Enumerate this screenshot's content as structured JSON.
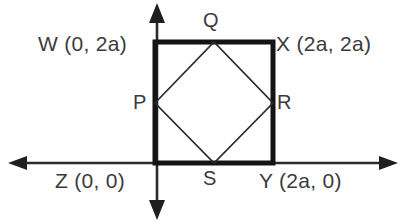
{
  "figure": {
    "background_color": "#ffffff",
    "stroke_color": "#1a1a1a",
    "label_color": "#3b3b3b",
    "axis_color": "#2b2b2b"
  },
  "axes": {
    "x_axis": {
      "name": "x-axis",
      "y_pixel": 163,
      "from_x": 8,
      "to_x": 398,
      "arrow_left": true,
      "arrow_right": true
    },
    "y_axis": {
      "name": "y-axis",
      "x_pixel": 157,
      "from_y": 3,
      "to_y": 220,
      "arrow_up": true,
      "arrow_down": true
    },
    "origin": {
      "x": 157,
      "y": 163
    }
  },
  "outer_square": {
    "name": "square-WXYZ",
    "stroke_width": 5,
    "left": 155,
    "right": 273,
    "top": 42,
    "bottom": 163,
    "vertices": [
      {
        "id": "W",
        "label": "W (0, 2a)",
        "point_name": "W",
        "coords": "(0, 2a)",
        "x": 155,
        "y": 42
      },
      {
        "id": "X",
        "label": "X (2a, 2a)",
        "point_name": "X",
        "coords": "(2a, 2a)",
        "x": 273,
        "y": 42
      },
      {
        "id": "Y",
        "label": "Y (2a, 0)",
        "point_name": "Y",
        "coords": "(2a, 0)",
        "x": 273,
        "y": 163
      },
      {
        "id": "Z",
        "label": "Z (0, 0)",
        "point_name": "Z",
        "coords": "(0, 0)",
        "x": 155,
        "y": 163
      }
    ]
  },
  "inner_square": {
    "name": "square-PQRS",
    "stroke_width": 1.6,
    "description": "Inscribed square joining midpoints of the sides of WXYZ",
    "vertices": [
      {
        "id": "P",
        "label": "P",
        "x": 155,
        "y": 103,
        "on_side": "WZ"
      },
      {
        "id": "Q",
        "label": "Q",
        "x": 214,
        "y": 42,
        "on_side": "WX"
      },
      {
        "id": "R",
        "label": "R",
        "x": 273,
        "y": 103,
        "on_side": "XY"
      },
      {
        "id": "S",
        "label": "S",
        "x": 214,
        "y": 163,
        "on_side": "ZY"
      }
    ]
  }
}
